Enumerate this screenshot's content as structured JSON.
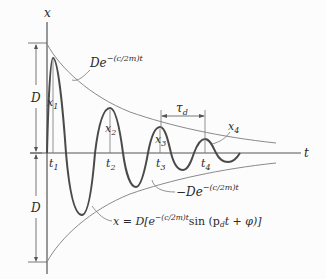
{
  "figure": {
    "type": "damped-oscillation-diagram",
    "axes": {
      "vertical_label": "x",
      "horizontal_label": "t"
    },
    "amplitude_label": "D",
    "upper_envelope_label": {
      "base": "De",
      "exponent": "−(c/2m)t"
    },
    "lower_envelope_label": {
      "base": "−De",
      "exponent": "−(c/2m)t"
    },
    "equation": {
      "lhs": "x = D[e",
      "exponent": "−(c/2m)t",
      "rhs_pre": "sin (p",
      "rhs_sub": "d",
      "rhs_post": "t + φ)]"
    },
    "period_label": {
      "base": "τ",
      "sub": "d"
    },
    "peaks": [
      {
        "x_label": "x",
        "x_sub": "1",
        "t_label": "t",
        "t_sub": "1"
      },
      {
        "x_label": "x",
        "x_sub": "2",
        "t_label": "t",
        "t_sub": "2"
      },
      {
        "x_label": "x",
        "x_sub": "3",
        "t_label": "t",
        "t_sub": "3"
      },
      {
        "x_label": "x",
        "x_sub": "4",
        "t_label": "t",
        "t_sub": "4"
      }
    ],
    "colors": {
      "curve": "#555555",
      "envelope": "#8a8a8a",
      "axis": "#555555",
      "text": "#2a2a2a"
    }
  }
}
